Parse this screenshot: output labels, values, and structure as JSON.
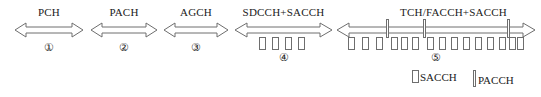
{
  "diagram": {
    "stroke_color": "#6e6e6e",
    "text_color": "#1a1a1a",
    "background": "#ffffff",
    "channels": [
      {
        "id": "pch",
        "label": "PCH",
        "index": "①",
        "x": 14,
        "width": 70,
        "sacch_count": 0,
        "pacch_count": 0
      },
      {
        "id": "pach",
        "label": "PACH",
        "index": "②",
        "x": 90,
        "width": 68,
        "sacch_count": 0,
        "pacch_count": 0
      },
      {
        "id": "agch",
        "label": "AGCH",
        "index": "③",
        "x": 163,
        "width": 66,
        "sacch_count": 0,
        "pacch_count": 0
      },
      {
        "id": "sdcch-sacch",
        "label": "SDCCH+SACCH",
        "index": "④",
        "x": 234,
        "width": 99,
        "sacch_count": 4,
        "pacch_count": 0
      },
      {
        "id": "tch-facch-sacch",
        "label": "TCH/FACCH+SACCH",
        "index": "⑤",
        "x": 336,
        "width": 200,
        "sacch_count": 15,
        "pacch_count": 3
      }
    ],
    "legend": [
      {
        "id": "sacch",
        "symbol": "sacch-box",
        "label": "SACCH"
      },
      {
        "id": "pacch",
        "symbol": "pacch-bar",
        "label": "PACCH"
      }
    ]
  }
}
